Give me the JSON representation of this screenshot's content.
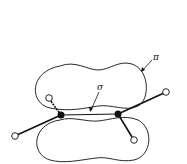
{
  "diagram": {
    "title": "",
    "labels": {
      "pi": "π",
      "sigma": "σ"
    },
    "components": [
      {
        "name": "pi-bond-upper-lobe",
        "kind": "orbital-lobe"
      },
      {
        "name": "pi-bond-lower-lobe",
        "kind": "orbital-lobe"
      },
      {
        "name": "sigma-bond",
        "kind": "bond"
      },
      {
        "name": "carbon-atom-left",
        "kind": "atom",
        "fill": "solid"
      },
      {
        "name": "carbon-atom-right",
        "kind": "atom",
        "fill": "solid"
      },
      {
        "name": "hydrogen-atom-left-upper",
        "kind": "atom",
        "fill": "hollow"
      },
      {
        "name": "hydrogen-atom-left-lower",
        "kind": "atom",
        "fill": "hollow"
      },
      {
        "name": "hydrogen-atom-right-upper",
        "kind": "atom",
        "fill": "hollow"
      },
      {
        "name": "hydrogen-atom-right-lower",
        "kind": "atom",
        "fill": "hollow"
      }
    ],
    "colors": {
      "line": "#111111",
      "background": "#ffffff"
    }
  }
}
